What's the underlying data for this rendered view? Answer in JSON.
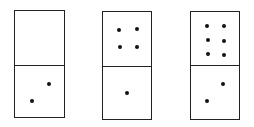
{
  "dominoes": [
    {
      "id": "domino-1",
      "box": {
        "x": 14,
        "y": 10,
        "w": 51,
        "h": 108
      },
      "divider_y": 54,
      "top_value": 0,
      "bottom_value": 2,
      "pips": [
        [
          34,
          73
        ],
        [
          17,
          90
        ]
      ]
    },
    {
      "id": "domino-2",
      "box": {
        "x": 102,
        "y": 11,
        "w": 50,
        "h": 109
      },
      "divider_y": 54,
      "top_value": 4,
      "bottom_value": 1,
      "pips": [
        [
          16,
          18
        ],
        [
          34,
          17
        ],
        [
          17,
          35
        ],
        [
          34,
          35
        ],
        [
          24,
          81
        ]
      ]
    },
    {
      "id": "domino-3",
      "box": {
        "x": 190,
        "y": 11,
        "w": 50,
        "h": 109
      },
      "divider_y": 53,
      "top_value": 6,
      "bottom_value": 2,
      "pips": [
        [
          16,
          14
        ],
        [
          33,
          14
        ],
        [
          17,
          28
        ],
        [
          33,
          29
        ],
        [
          17,
          42
        ],
        [
          33,
          43
        ],
        [
          32,
          72
        ],
        [
          16,
          89
        ]
      ]
    }
  ],
  "colors": {
    "stroke": "#222222",
    "pip": "#111111",
    "background": "#ffffff"
  }
}
